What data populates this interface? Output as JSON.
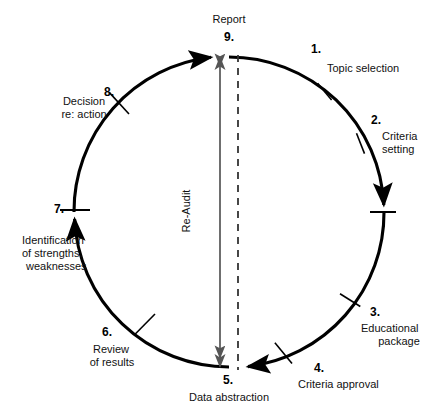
{
  "diagram": {
    "center_label": "Re-Audit",
    "report_label": "Report",
    "colors": {
      "stroke": "#000000",
      "text": "#111111",
      "background": "#ffffff",
      "inner_arrow": "#555555"
    },
    "geometry": {
      "center_x": 229,
      "center_y": 212,
      "radius": 155
    },
    "steps": [
      {
        "number": "1.",
        "label": "Topic selection",
        "angle_deg": 50
      },
      {
        "number": "2.",
        "label": "Criteria\nsetting",
        "angle_deg": 20
      },
      {
        "number": "3.",
        "label": "Educational\npackage",
        "angle_deg": -40
      },
      {
        "number": "4.",
        "label": "Criteria approval",
        "angle_deg": -68
      },
      {
        "number": "5.",
        "label": "Data abstraction",
        "angle_deg": -90
      },
      {
        "number": "6.",
        "label": "Review\nof results",
        "angle_deg": -120
      },
      {
        "number": "7.",
        "label": "Identification\nof strengths,\nweaknesses",
        "angle_deg": 180
      },
      {
        "number": "8.",
        "label": "Decision\nre: action",
        "angle_deg": 133
      },
      {
        "number": "9.",
        "label": "Report",
        "angle_deg": 90
      }
    ],
    "step_labels": {
      "s1": "Topic selection",
      "s2_line1": "Criteria",
      "s2_line2": "setting",
      "s3_line1": "Educational",
      "s3_line2": "package",
      "s4": "Criteria approval",
      "s5": "Data abstraction",
      "s6_line1": "Review",
      "s6_line2": "of results",
      "s7_line1": "Identification",
      "s7_line2": "of strengths,",
      "s7_line3": "weaknesses",
      "s8_line1": "Decision",
      "s8_line2": "re: action",
      "s9": "Report"
    },
    "step_numbers": {
      "n1": "1.",
      "n2": "2.",
      "n3": "3.",
      "n4": "4.",
      "n5": "5.",
      "n6": "6.",
      "n7": "7.",
      "n8": "8.",
      "n9": "9."
    }
  }
}
